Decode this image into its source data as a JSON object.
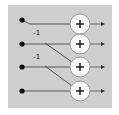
{
  "diagram": {
    "type": "butterfly-adder-network",
    "panel": {
      "x": 8,
      "y": 5,
      "width": 104,
      "height": 103,
      "color": "#cfcfcf"
    },
    "rows": [
      {
        "id": "row-1",
        "y": 21,
        "input_x": 22,
        "adder_x": 80,
        "output_x": 105
      },
      {
        "id": "row-2",
        "y": 44,
        "input_x": 22,
        "adder_x": 80,
        "output_x": 105
      },
      {
        "id": "row-3",
        "y": 67,
        "input_x": 22,
        "adder_x": 80,
        "output_x": 105
      },
      {
        "id": "row-4",
        "y": 91,
        "input_x": 22,
        "adder_x": 80,
        "output_x": 105
      }
    ],
    "adder": {
      "symbol": "+",
      "radius": 10
    },
    "cross_connections": [
      {
        "from_row": 2,
        "to_row": 3,
        "start": [
          45,
          43
        ],
        "end": [
          72,
          62
        ],
        "coefficient": "-1",
        "label_pos": [
          33,
          35
        ]
      },
      {
        "from_row": 3,
        "to_row": 4,
        "start": [
          45,
          66
        ],
        "end": [
          72,
          86
        ],
        "coefficient": "-1",
        "label_pos": [
          33,
          59
        ]
      }
    ]
  }
}
